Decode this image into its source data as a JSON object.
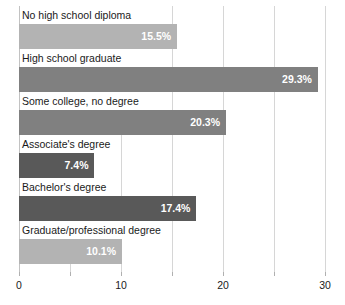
{
  "chart_data": {
    "type": "bar",
    "orientation": "horizontal",
    "title": "",
    "subtitle": "",
    "xlabel": "",
    "ylabel": "",
    "xlim": [
      0,
      30
    ],
    "grid": true,
    "legend": null,
    "tick_interval": 5,
    "categories": [
      "No high school diploma",
      "High school graduate",
      "Some college, no degree",
      "Associate's degree",
      "Bachelor's degree",
      "Graduate/professional degree"
    ],
    "values": [
      15.5,
      29.3,
      20.3,
      7.4,
      17.4,
      10.1
    ],
    "value_labels": [
      "15.5%",
      "29.3%",
      "20.3%",
      "7.4%",
      "17.4%",
      "10.1%"
    ],
    "bar_colors": [
      "#b3b3b3",
      "#808080",
      "#808080",
      "#595959",
      "#595959",
      "#b3b3b3"
    ],
    "xticks": [
      0,
      5,
      10,
      15,
      20,
      25,
      30
    ],
    "xtick_labels": [
      "0",
      "",
      "10",
      "",
      "20",
      "",
      "30"
    ],
    "gridline_color": "#d6d6d6",
    "value_label_color": "#ffffff",
    "category_label_color": "#1a1a1a",
    "background_color": "#ffffff"
  }
}
